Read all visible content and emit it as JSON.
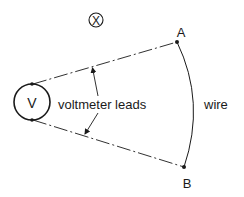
{
  "diagram": {
    "field_symbol": "X",
    "field_symbol_meaning": "magnetic field into page",
    "meter": {
      "label": "V"
    },
    "points": {
      "a": "A",
      "b": "B"
    },
    "labels": {
      "leads": "voltmeter leads",
      "wire": "wire"
    },
    "colors": {
      "ink": "#1a1a1a",
      "background": "#ffffff"
    }
  }
}
